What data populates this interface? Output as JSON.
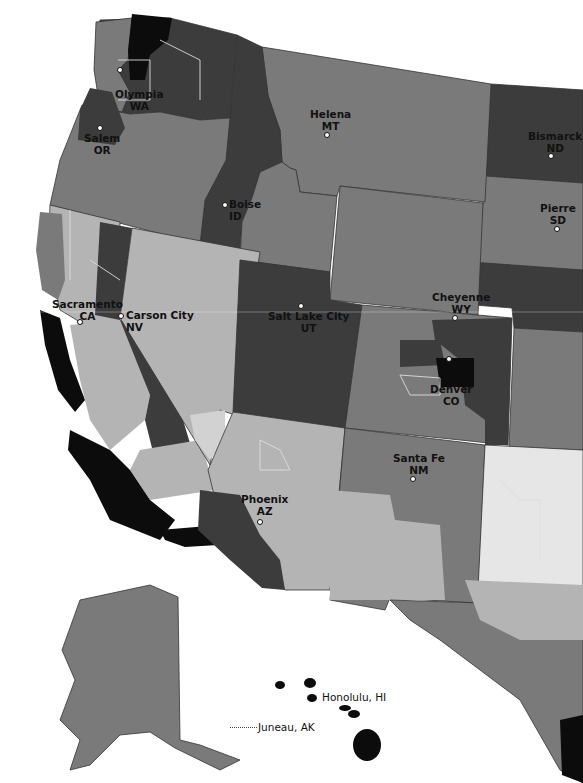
{
  "map": {
    "type": "choropleth",
    "region": "Western United States congressional districts (grayscale shading)",
    "colors": {
      "very_dark": "#0c0c0c",
      "dark": "#3c3c3c",
      "medium": "#7a7a7a",
      "medium_light": "#8f8f8f",
      "light": "#b4b4b4",
      "very_light": "#d2d2d2",
      "lightest": "#e6e6e6",
      "background": "#ffffff"
    },
    "capitals": [
      {
        "city": "Olympia",
        "state": "WA"
      },
      {
        "city": "Salem",
        "state": "OR"
      },
      {
        "city": "Boise",
        "state": "ID"
      },
      {
        "city": "Helena",
        "state": "MT"
      },
      {
        "city": "Bismarck",
        "state": "ND"
      },
      {
        "city": "Pierre",
        "state": "SD"
      },
      {
        "city": "Cheyenne",
        "state": "WY"
      },
      {
        "city": "Salt Lake City",
        "state": "UT"
      },
      {
        "city": "Sacramento",
        "state": "CA"
      },
      {
        "city": "Carson City",
        "state": "NV"
      },
      {
        "city": "Denver",
        "state": "CO"
      },
      {
        "city": "Santa Fe",
        "state": "NM"
      },
      {
        "city": "Phoenix",
        "state": "AZ"
      }
    ],
    "inset_labels": {
      "alaska": "Juneau, AK",
      "hawaii": "Honolulu, HI"
    }
  }
}
